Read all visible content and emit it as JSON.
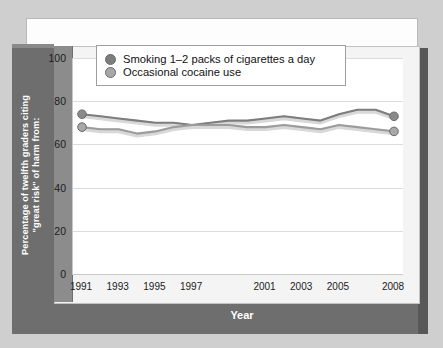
{
  "chart_data": {
    "type": "line",
    "title": "",
    "xlabel": "Year",
    "ylabel": "Percentage of twelfth graders citing \"great risk\" of harm from:",
    "ylabel_line1": "Percentage of twelfth graders citing",
    "ylabel_line2": "\"great risk\" of harm from:",
    "ylim": [
      0,
      100
    ],
    "yticks": [
      0,
      20,
      40,
      60,
      80,
      100
    ],
    "grid": true,
    "legend_position": "top-left-inside",
    "x": [
      1991,
      1992,
      1993,
      1994,
      1995,
      1996,
      1997,
      1998,
      1999,
      2000,
      2001,
      2002,
      2003,
      2004,
      2005,
      2006,
      2007,
      2008
    ],
    "xtick_labels": [
      "1991",
      "1993",
      "1995",
      "1997",
      "2001",
      "2003",
      "2005",
      "2008"
    ],
    "xtick_values": [
      1991,
      1993,
      1995,
      1997,
      2001,
      2003,
      2005,
      2008
    ],
    "series": [
      {
        "name": "Smoking 1–2 packs of cigarettes a day",
        "color": "#7d7d7d",
        "marker_endpoints": true,
        "values": [
          74,
          73,
          72,
          71,
          70,
          70,
          69,
          70,
          71,
          71,
          72,
          73,
          72,
          71,
          74,
          76,
          76,
          73
        ]
      },
      {
        "name": "Occasional cocaine use",
        "color": "#9c9c9c",
        "marker_endpoints": true,
        "values": [
          68,
          67,
          67,
          65,
          66,
          68,
          69,
          69,
          69,
          68,
          68,
          69,
          68,
          67,
          69,
          68,
          67,
          66
        ]
      }
    ]
  },
  "legend": {
    "items": [
      {
        "label": "Smoking 1–2 packs of cigarettes a day",
        "color": "#7d7d7d"
      },
      {
        "label": "Occasional cocaine use",
        "color": "#a8a8a8"
      }
    ]
  },
  "colors": {
    "page_background": "#cfcfcf",
    "slab": "#6e6e6e",
    "axis_band": "#8c8c8c",
    "plot_background": "#ffffff",
    "gridline": "#dcdcdc",
    "series_1": "#7d7d7d",
    "series_2": "#a8a8a8",
    "text_dark": "#1b1b1b",
    "text_light": "#ffffff"
  }
}
